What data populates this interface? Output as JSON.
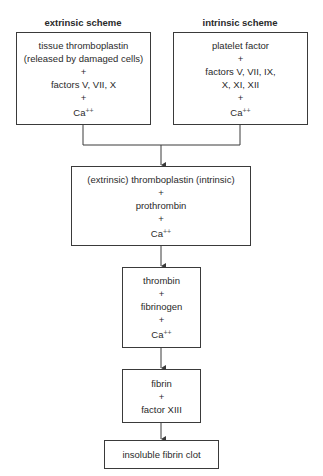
{
  "extrinsic": {
    "header": "extrinsic scheme",
    "lines": [
      "tissue thromboplastin",
      "(released by damaged cells)",
      "+",
      "factors V, VII, X",
      "+",
      "Ca"
    ],
    "ca_superscript": "++"
  },
  "intrinsic": {
    "header": "intrinsic scheme",
    "lines": [
      "platelet factor",
      "+",
      "factors V, VII, IX,",
      "X, XI, XII",
      "+",
      "Ca"
    ],
    "ca_superscript": "++"
  },
  "combined": {
    "lines": [
      "(extrinsic) thromboplastin (intrinsic)",
      "+",
      "prothrombin",
      "+",
      "Ca"
    ],
    "ca_superscript": "++"
  },
  "thrombin_step": {
    "lines": [
      "thrombin",
      "+",
      "fibrinogen",
      "+",
      "Ca"
    ],
    "ca_superscript": "++"
  },
  "fibrin_step": {
    "lines": [
      "fibrin",
      "+",
      "factor XIII"
    ]
  },
  "result": {
    "label": "insoluble fibrin clot"
  },
  "colors": {
    "line": "#3a3a3a",
    "text": "#2a2a2a"
  }
}
